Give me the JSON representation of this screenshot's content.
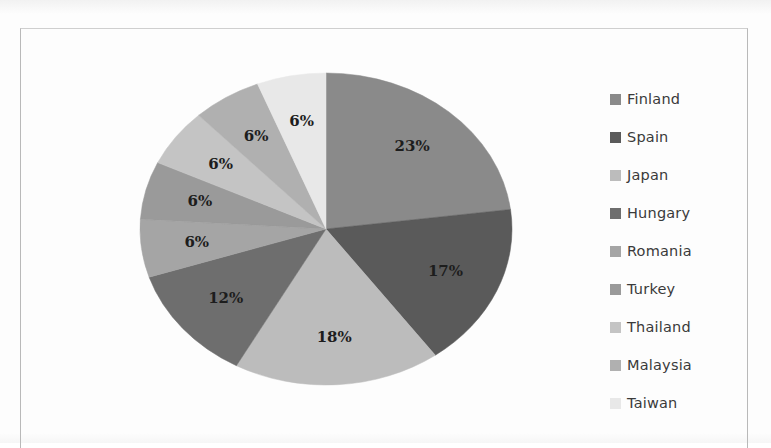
{
  "chart_data": {
    "type": "pie",
    "title": "",
    "subtitle": "",
    "xlabel": "",
    "ylabel": "",
    "legend_position": "right",
    "grid": false,
    "labels_show_percent": true,
    "start_angle_deg": 0,
    "direction": "clockwise",
    "categories": [
      "Finland",
      "Spain",
      "Japan",
      "Hungary",
      "Romania",
      "Turkey",
      "Thailand",
      "Malaysia",
      "Taiwan"
    ],
    "values": [
      23,
      17,
      18,
      12,
      6,
      6,
      6,
      6,
      6
    ],
    "value_labels": [
      "23%",
      "17%",
      "18%",
      "12%",
      "6%",
      "6%",
      "6%",
      "6%",
      "6%"
    ],
    "colors": [
      "#8a8a8a",
      "#5a5a5a",
      "#bcbcbc",
      "#6e6e6e",
      "#a5a5a5",
      "#9a9a9a",
      "#c4c4c4",
      "#b0b0b0",
      "#e8e8e8"
    ],
    "slices": [
      {
        "label": "Finland",
        "value": 23,
        "display": "23%",
        "color": "#8a8a8a"
      },
      {
        "label": "Spain",
        "value": 17,
        "display": "17%",
        "color": "#5a5a5a"
      },
      {
        "label": "Japan",
        "value": 18,
        "display": "18%",
        "color": "#bcbcbc"
      },
      {
        "label": "Hungary",
        "value": 12,
        "display": "12%",
        "color": "#6e6e6e"
      },
      {
        "label": "Romania",
        "value": 6,
        "display": "6%",
        "color": "#a5a5a5"
      },
      {
        "label": "Turkey",
        "value": 6,
        "display": "6%",
        "color": "#9a9a9a"
      },
      {
        "label": "Thailand",
        "value": 6,
        "display": "6%",
        "color": "#c4c4c4"
      },
      {
        "label": "Malaysia",
        "value": 6,
        "display": "6%",
        "color": "#b0b0b0"
      },
      {
        "label": "Taiwan",
        "value": 6,
        "display": "6%",
        "color": "#e8e8e8"
      }
    ]
  },
  "legend": {
    "items": [
      {
        "label": "Finland",
        "color": "#8a8a8a"
      },
      {
        "label": "Spain",
        "color": "#5a5a5a"
      },
      {
        "label": "Japan",
        "color": "#bcbcbc"
      },
      {
        "label": "Hungary",
        "color": "#6e6e6e"
      },
      {
        "label": "Romania",
        "color": "#a5a5a5"
      },
      {
        "label": "Turkey",
        "color": "#9a9a9a"
      },
      {
        "label": "Thailand",
        "color": "#c4c4c4"
      },
      {
        "label": "Malaysia",
        "color": "#b0b0b0"
      },
      {
        "label": "Taiwan",
        "color": "#e8e8e8"
      }
    ]
  },
  "frame": {
    "border_color": "#b9b9b9"
  }
}
